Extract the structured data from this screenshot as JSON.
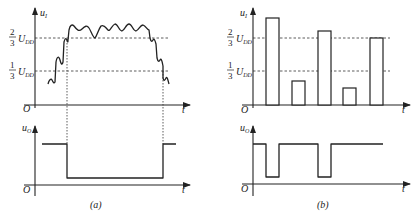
{
  "figure": {
    "panel_a": {
      "caption": "(a)",
      "input_axis": {
        "label": "u",
        "label_sub": "I",
        "origin": "O",
        "time": "t"
      },
      "output_axis": {
        "label": "u",
        "label_sub": "O",
        "origin": "O",
        "time": "t"
      },
      "thresholds": [
        {
          "num": "2",
          "den": "3",
          "sym": "U",
          "sub": "DD"
        },
        {
          "num": "1",
          "den": "3",
          "sym": "U",
          "sub": "DD"
        }
      ],
      "description": "Noisy input rises through 1/3 UDD and 2/3 UDD, oscillates above 2/3 UDD, then falls; output goes low between crossings"
    },
    "panel_b": {
      "caption": "(b)",
      "input_axis": {
        "label": "u",
        "label_sub": "I",
        "origin": "O",
        "time": "t"
      },
      "output_axis": {
        "label": "u",
        "label_sub": "O",
        "origin": "O",
        "time": "t"
      },
      "thresholds": [
        {
          "num": "2",
          "den": "3",
          "sym": "U",
          "sub": "DD"
        },
        {
          "num": "1",
          "den": "3",
          "sym": "U",
          "sub": "DD"
        }
      ],
      "pulses": [
        {
          "index": 1,
          "level": "above 2/3 UDD"
        },
        {
          "index": 2,
          "level": "below 1/3 UDD"
        },
        {
          "index": 3,
          "level": "above 2/3 UDD"
        },
        {
          "index": 4,
          "level": "below 1/3 UDD"
        },
        {
          "index": 5,
          "level": "at 2/3 UDD"
        }
      ],
      "description": "Input pulse train; output low during pulses 1 and 3"
    }
  }
}
